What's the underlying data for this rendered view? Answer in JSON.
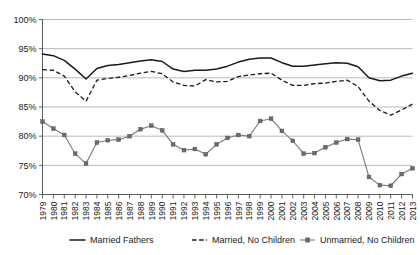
{
  "chart_data": {
    "type": "line",
    "title": "",
    "subtitle": "",
    "xlabel": "",
    "ylabel": "",
    "ylim": [
      70,
      100
    ],
    "ytick_labels": [
      "100%",
      "95%",
      "90%",
      "85%",
      "80%",
      "75%",
      "70%"
    ],
    "ytick_values": [
      100,
      95,
      90,
      85,
      80,
      75,
      70
    ],
    "grid": true,
    "legend_position": "bottom",
    "x": [
      1979,
      1980,
      1981,
      1982,
      1983,
      1984,
      1985,
      1986,
      1987,
      1988,
      1989,
      1990,
      1991,
      1992,
      1993,
      1994,
      1995,
      1996,
      1997,
      1998,
      1999,
      2000,
      2001,
      2002,
      2003,
      2004,
      2005,
      2006,
      2007,
      2008,
      2009,
      2010,
      2011,
      2012,
      2013
    ],
    "xtick_labels": [
      "1979",
      "1980",
      "1981",
      "1982",
      "1983",
      "1984",
      "1985",
      "1986",
      "1987",
      "1988",
      "1989",
      "1990",
      "1991",
      "1992",
      "1993",
      "1994",
      "1995",
      "1996",
      "1997",
      "1998",
      "1999",
      "2000",
      "2001",
      "2002",
      "2003",
      "2004",
      "2005",
      "2006",
      "2007",
      "2008",
      "2009",
      "2010",
      "2011",
      "2012",
      "2013"
    ],
    "series": [
      {
        "name": "Married Fathers",
        "style": "solid",
        "color": "#1a1a1a",
        "markers": false,
        "values": [
          94.1,
          93.8,
          93.0,
          91.5,
          89.8,
          91.6,
          92.1,
          92.3,
          92.6,
          92.9,
          93.1,
          92.8,
          91.5,
          91.1,
          91.3,
          91.3,
          91.5,
          92.0,
          92.7,
          93.2,
          93.4,
          93.4,
          92.6,
          92.0,
          92.0,
          92.2,
          92.4,
          92.6,
          92.5,
          91.9,
          90.0,
          89.5,
          89.6,
          90.3,
          90.8
        ]
      },
      {
        "name": "Married, No Children",
        "style": "dashed",
        "color": "#1a1a1a",
        "markers": false,
        "values": [
          91.4,
          91.3,
          90.3,
          87.6,
          86.0,
          89.6,
          89.9,
          90.1,
          90.4,
          90.8,
          91.1,
          90.7,
          89.3,
          88.7,
          88.6,
          89.7,
          89.3,
          89.4,
          90.2,
          90.5,
          90.7,
          90.8,
          89.6,
          88.7,
          88.7,
          89.0,
          89.1,
          89.4,
          89.6,
          88.5,
          86.0,
          84.4,
          83.6,
          84.5,
          85.5
        ]
      },
      {
        "name": "Unmarried, No Children",
        "style": "solid-markers",
        "color": "#6b6b6b",
        "markers": true,
        "values": [
          82.5,
          81.3,
          80.2,
          77.0,
          75.3,
          78.9,
          79.3,
          79.4,
          80.0,
          81.2,
          81.8,
          81.0,
          78.6,
          77.6,
          77.8,
          76.9,
          78.6,
          79.7,
          80.2,
          80.0,
          82.6,
          83.0,
          80.9,
          79.2,
          77.0,
          77.1,
          78.1,
          78.9,
          79.5,
          79.4,
          73.0,
          71.6,
          71.5,
          73.5,
          74.5
        ]
      }
    ]
  }
}
